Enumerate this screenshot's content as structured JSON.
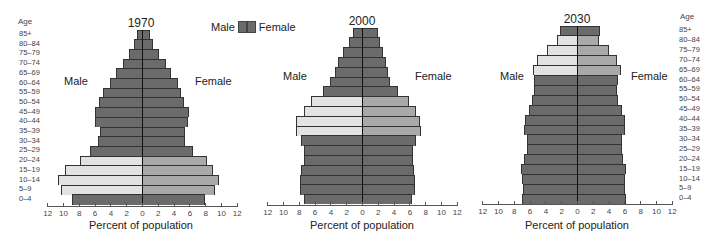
{
  "legend": {
    "male": "Male",
    "female": "Female"
  },
  "age_header": "Age",
  "age_groups": [
    "85+",
    "80–84",
    "75–79",
    "70–74",
    "65–69",
    "60–64",
    "55–59",
    "50–54",
    "45–49",
    "40–44",
    "35–39",
    "30–34",
    "25–29",
    "20–24",
    "15–19",
    "10–14",
    "5–9",
    "0–4"
  ],
  "colors": {
    "base": "#6b6b6b",
    "male_highlight": "#e2e2e2",
    "female_highlight": "#a9a9a9",
    "outline": "#333333"
  },
  "chart_data": [
    {
      "type": "bar",
      "title": "1970",
      "subtype": "population-pyramid",
      "xlabel": "Percent of population",
      "ylabel": "Age",
      "xticks": [
        12,
        10,
        8,
        6,
        4,
        2,
        0,
        2,
        4,
        6,
        8,
        10,
        12
      ],
      "xlim": [
        -12,
        12
      ],
      "side_labels": {
        "left": "Male",
        "right": "Female"
      },
      "categories": [
        "85+",
        "80–84",
        "75–79",
        "70–74",
        "65–69",
        "60–64",
        "55–59",
        "50–54",
        "45–49",
        "40–44",
        "35–39",
        "30–34",
        "25–29",
        "20–24",
        "15–19",
        "10–14",
        "5–9",
        "0–4"
      ],
      "series": [
        {
          "name": "Male",
          "values": [
            0.6,
            1.0,
            1.7,
            2.4,
            3.3,
            4.1,
            4.9,
            5.5,
            5.9,
            5.9,
            5.3,
            5.6,
            6.6,
            7.9,
            9.7,
            10.6,
            10.3,
            8.9
          ]
        },
        {
          "name": "Female",
          "values": [
            1.0,
            1.4,
            2.2,
            3.0,
            3.7,
            4.5,
            4.9,
            5.3,
            6.0,
            5.8,
            5.4,
            5.5,
            6.5,
            8.2,
            9.0,
            9.7,
            9.2,
            8.0
          ]
        }
      ],
      "highlighted": [
        "20–24",
        "15–19",
        "10–14",
        "5–9"
      ]
    },
    {
      "type": "bar",
      "title": "2000",
      "subtype": "population-pyramid",
      "xlabel": "Percent of population",
      "ylabel": "Age",
      "xticks": [
        12,
        10,
        8,
        6,
        4,
        2,
        0,
        2,
        4,
        6,
        8,
        10,
        12
      ],
      "xlim": [
        -12,
        12
      ],
      "side_labels": {
        "left": "Male",
        "right": "Female"
      },
      "categories": [
        "85+",
        "80–84",
        "75–79",
        "70–74",
        "65–69",
        "60–64",
        "55–59",
        "50–54",
        "45–49",
        "40–44",
        "35–39",
        "30–34",
        "25–29",
        "20–24",
        "15–19",
        "10–14",
        "5–9",
        "0–4"
      ],
      "series": [
        {
          "name": "Male",
          "values": [
            1.1,
            1.6,
            2.4,
            3.0,
            3.4,
            4.0,
            4.9,
            6.5,
            7.4,
            8.3,
            8.4,
            7.7,
            7.4,
            7.3,
            7.7,
            7.8,
            7.8,
            7.3
          ]
        },
        {
          "name": "Female",
          "values": [
            2.0,
            2.3,
            2.7,
            3.0,
            3.3,
            3.5,
            4.6,
            5.9,
            6.8,
            7.4,
            7.5,
            6.8,
            6.5,
            6.4,
            6.6,
            6.7,
            6.7,
            6.3
          ]
        }
      ],
      "highlighted": [
        "50–54",
        "45–49",
        "40–44",
        "35–39"
      ]
    },
    {
      "type": "bar",
      "title": "2030",
      "subtype": "population-pyramid",
      "xlabel": "Percent of population",
      "ylabel": "Age",
      "xticks": [
        12,
        10,
        8,
        6,
        4,
        2,
        0,
        2,
        4,
        6,
        8,
        10,
        12
      ],
      "xlim": [
        -12,
        12
      ],
      "side_labels": {
        "left": "Male",
        "right": "Female"
      },
      "categories": [
        "85+",
        "80–84",
        "75–79",
        "70–74",
        "65–69",
        "60–64",
        "55–59",
        "50–54",
        "45–49",
        "40–44",
        "35–39",
        "30–34",
        "25–29",
        "20–24",
        "15–19",
        "10–14",
        "5–9",
        "0–4"
      ],
      "series": [
        {
          "name": "Male",
          "values": [
            2.1,
            2.5,
            3.8,
            5.1,
            5.6,
            5.5,
            5.4,
            5.7,
            6.1,
            6.6,
            6.7,
            6.3,
            6.3,
            6.7,
            7.1,
            7.0,
            6.8,
            7.0
          ]
        },
        {
          "name": "Female",
          "values": [
            2.9,
            2.8,
            4.0,
            5.0,
            5.6,
            5.2,
            5.1,
            5.2,
            5.7,
            6.1,
            6.1,
            5.7,
            5.7,
            5.8,
            6.2,
            6.1,
            6.1,
            6.2
          ]
        }
      ],
      "highlighted": [
        "80–84",
        "75–79",
        "70–74",
        "65–69"
      ]
    }
  ]
}
